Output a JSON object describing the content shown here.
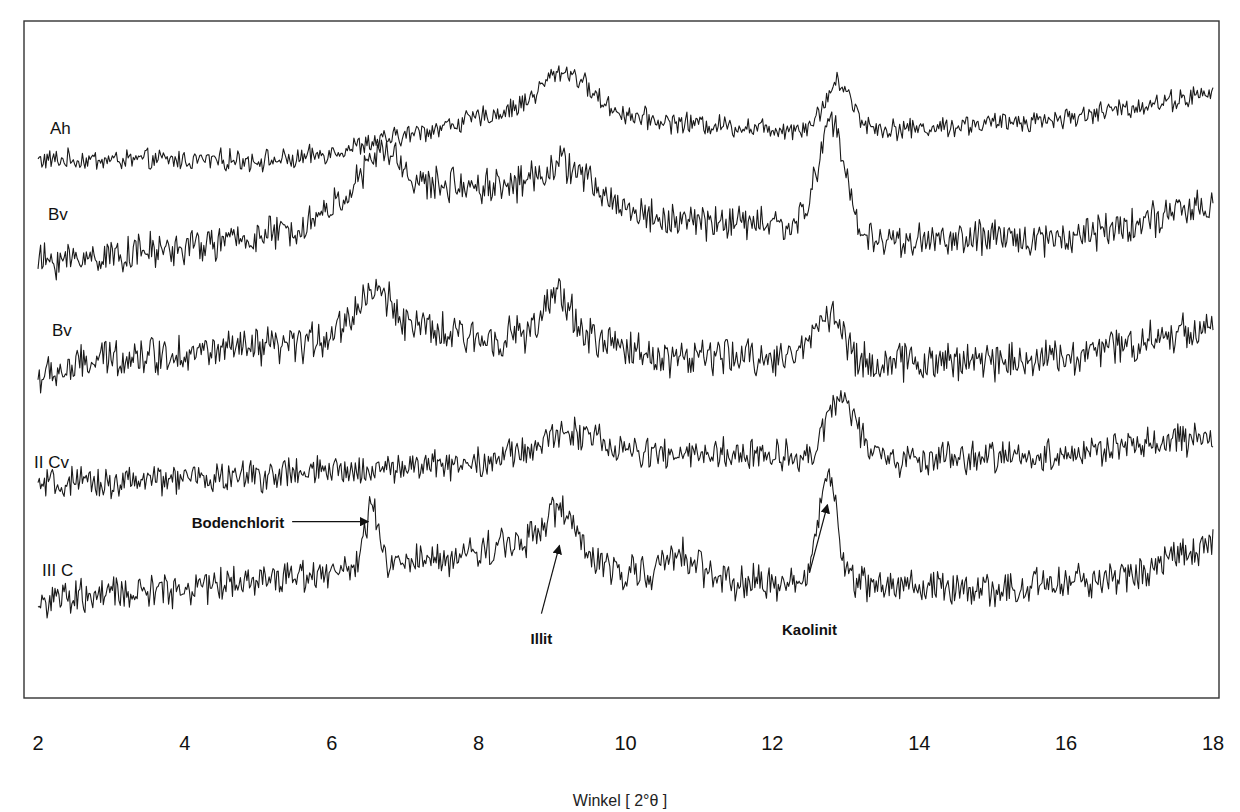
{
  "chart_data": {
    "type": "line",
    "title": "",
    "xlabel": "Winkel   [ 2°θ ]",
    "ylabel": "",
    "xlim": [
      2,
      18
    ],
    "x_ticks": [
      "2",
      "4",
      "6",
      "8",
      "10",
      "12",
      "14",
      "16",
      "18"
    ],
    "grid": false,
    "legend": "none (inline trace labels at left)",
    "series": [
      {
        "name": "Ah",
        "offset": 0,
        "baseline": [
          [
            2,
            0.0
          ],
          [
            5.5,
            0.0
          ],
          [
            7.0,
            0.35
          ],
          [
            9.0,
            0.85
          ],
          [
            10.5,
            0.55
          ],
          [
            12.0,
            0.45
          ],
          [
            14.0,
            0.45
          ],
          [
            16.0,
            0.6
          ],
          [
            18.0,
            0.95
          ]
        ],
        "peaks": [
          {
            "x": 9.2,
            "height": 0.45,
            "width": 0.3
          },
          {
            "x": 12.9,
            "height": 0.65,
            "width": 0.18
          }
        ],
        "noise": 0.12
      },
      {
        "name": "Bv",
        "offset": 1,
        "baseline": [
          [
            2,
            0.0
          ],
          [
            4.0,
            0.2
          ],
          [
            5.5,
            0.45
          ],
          [
            6.2,
            0.9
          ],
          [
            7.5,
            1.1
          ],
          [
            9.0,
            1.1
          ],
          [
            10.5,
            0.6
          ],
          [
            12.0,
            0.55
          ],
          [
            13.5,
            0.3
          ],
          [
            16.0,
            0.35
          ],
          [
            18.0,
            0.8
          ]
        ],
        "peaks": [
          {
            "x": 6.7,
            "height": 0.6,
            "width": 0.25
          },
          {
            "x": 9.2,
            "height": 0.35,
            "width": 0.3
          },
          {
            "x": 12.8,
            "height": 1.6,
            "width": 0.18
          }
        ],
        "noise": 0.2
      },
      {
        "name": "Bv",
        "offset": 2,
        "baseline": [
          [
            2,
            0.0
          ],
          [
            3.0,
            0.3
          ],
          [
            5.5,
            0.45
          ],
          [
            6.5,
            0.8
          ],
          [
            8.0,
            0.55
          ],
          [
            9.0,
            0.7
          ],
          [
            10.5,
            0.3
          ],
          [
            12.0,
            0.3
          ],
          [
            13.2,
            0.2
          ],
          [
            16.0,
            0.3
          ],
          [
            18.0,
            0.75
          ]
        ],
        "peaks": [
          {
            "x": 6.6,
            "height": 0.45,
            "width": 0.25
          },
          {
            "x": 9.1,
            "height": 0.55,
            "width": 0.15
          },
          {
            "x": 12.75,
            "height": 0.7,
            "width": 0.2
          }
        ],
        "noise": 0.22
      },
      {
        "name": "II Cv",
        "offset": 3,
        "baseline": [
          [
            2,
            0.0
          ],
          [
            6.0,
            0.2
          ],
          [
            8.0,
            0.35
          ],
          [
            9.0,
            0.55
          ],
          [
            10.5,
            0.45
          ],
          [
            12.0,
            0.45
          ],
          [
            13.2,
            0.35
          ],
          [
            16.0,
            0.45
          ],
          [
            18.0,
            0.7
          ]
        ],
        "peaks": [
          {
            "x": 9.3,
            "height": 0.25,
            "width": 0.3
          },
          {
            "x": 12.95,
            "height": 0.9,
            "width": 0.2
          }
        ],
        "noise": 0.18
      },
      {
        "name": "III C",
        "offset": 4,
        "baseline": [
          [
            2,
            0.0
          ],
          [
            4.0,
            0.2
          ],
          [
            6.0,
            0.45
          ],
          [
            7.5,
            0.6
          ],
          [
            9.0,
            1.0
          ],
          [
            9.6,
            0.5
          ],
          [
            11.0,
            0.35
          ],
          [
            12.0,
            0.25
          ],
          [
            13.0,
            0.3
          ],
          [
            15.0,
            0.15
          ],
          [
            17.0,
            0.4
          ],
          [
            18.0,
            0.9
          ]
        ],
        "peaks": [
          {
            "x": 6.55,
            "height": 0.9,
            "width": 0.08
          },
          {
            "x": 9.15,
            "height": 0.4,
            "width": 0.2
          },
          {
            "x": 10.8,
            "height": 0.3,
            "width": 0.2
          },
          {
            "x": 12.75,
            "height": 1.6,
            "width": 0.12
          }
        ],
        "noise": 0.2
      }
    ],
    "annotations": [
      {
        "text": "Bodenchlorit",
        "series": "III C",
        "x": 6.55,
        "arrow": "horizontal-right"
      },
      {
        "text": "Illit",
        "series": "III C",
        "x": 9.1,
        "arrow": "diagonal-up"
      },
      {
        "text": "Kaolinit",
        "series": "III C",
        "x": 12.75,
        "arrow": "diagonal-up"
      }
    ]
  }
}
